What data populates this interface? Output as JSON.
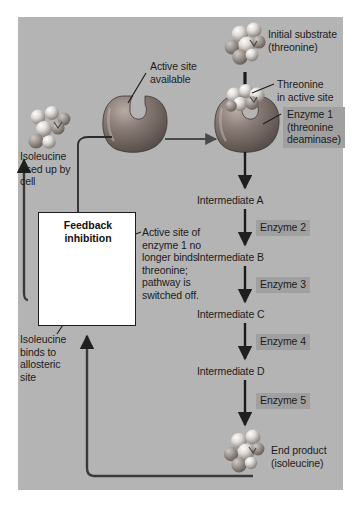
{
  "figure": {
    "panel_bg": "#b4b4b4",
    "label_box_bg": "#a0a0a0",
    "line_color": "#2a2a2a"
  },
  "labels": {
    "initial_substrate": "Initial substrate\n(threonine)",
    "active_site_available": "Active site\navailable",
    "threonine_in_active_site": "Threonine\nin active site",
    "isoleucine_used_up": "Isoleucine\nused up by\ncell",
    "isoleucine_binds": "Isoleucine\nbinds to\nallosteric\nsite",
    "feedback_inhibition": "Feedback\ninhibition",
    "active_site_off": "Active site of\nenzyme 1 no\nlonger binds\nthreonine;\npathway is\nswitched off.",
    "end_product": "End product\n(isoleucine)"
  },
  "pathway": {
    "enzymes": [
      {
        "name": "Enzyme 1\n(threonine\ndeaminase)",
        "boxed": true
      },
      {
        "name": "Enzyme 2",
        "boxed": true
      },
      {
        "name": "Enzyme 3",
        "boxed": true
      },
      {
        "name": "Enzyme 4",
        "boxed": true
      },
      {
        "name": "Enzyme 5",
        "boxed": true
      }
    ],
    "intermediates": [
      "Intermediate A",
      "Intermediate B",
      "Intermediate C",
      "Intermediate D"
    ]
  }
}
